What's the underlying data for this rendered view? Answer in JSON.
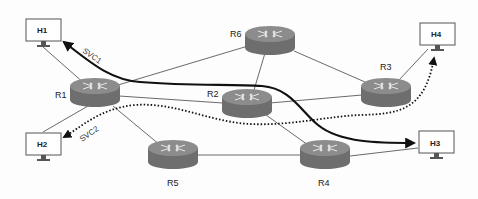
{
  "diagram": {
    "type": "network-topology",
    "hosts": [
      {
        "id": "H1",
        "label": "H1"
      },
      {
        "id": "H2",
        "label": "H2"
      },
      {
        "id": "H3",
        "label": "H3"
      },
      {
        "id": "H4",
        "label": "H4"
      }
    ],
    "routers": [
      {
        "id": "R1",
        "label": "R1"
      },
      {
        "id": "R2",
        "label": "R2"
      },
      {
        "id": "R3",
        "label": "R3"
      },
      {
        "id": "R4",
        "label": "R4"
      },
      {
        "id": "R5",
        "label": "R5"
      },
      {
        "id": "R6",
        "label": "R6"
      }
    ],
    "links": [
      [
        "H1",
        "R1"
      ],
      [
        "H2",
        "R1"
      ],
      [
        "R1",
        "R6"
      ],
      [
        "R1",
        "R2"
      ],
      [
        "R1",
        "R5"
      ],
      [
        "R6",
        "R2"
      ],
      [
        "R6",
        "R3"
      ],
      [
        "R2",
        "R3"
      ],
      [
        "R2",
        "R4"
      ],
      [
        "R5",
        "R4"
      ],
      [
        "R4",
        "H3"
      ],
      [
        "R3",
        "H4"
      ]
    ],
    "services": [
      {
        "id": "SVC1",
        "label": "SVC1",
        "style": "solid",
        "color": "#111111",
        "path": [
          "H3",
          "R2",
          "R1",
          "H1"
        ],
        "direction": "toward H1 and H3"
      },
      {
        "id": "SVC2",
        "label": "SVC2",
        "style": "dotted",
        "color": "#111111",
        "path": [
          "H4",
          "R3",
          "R2",
          "R1",
          "H2"
        ],
        "direction": "toward H2 and H4"
      }
    ],
    "colors": {
      "router_top": "#8a8a8a",
      "router_side": "#6b6b6b",
      "link": "#444444",
      "host_border": "#555555"
    }
  }
}
